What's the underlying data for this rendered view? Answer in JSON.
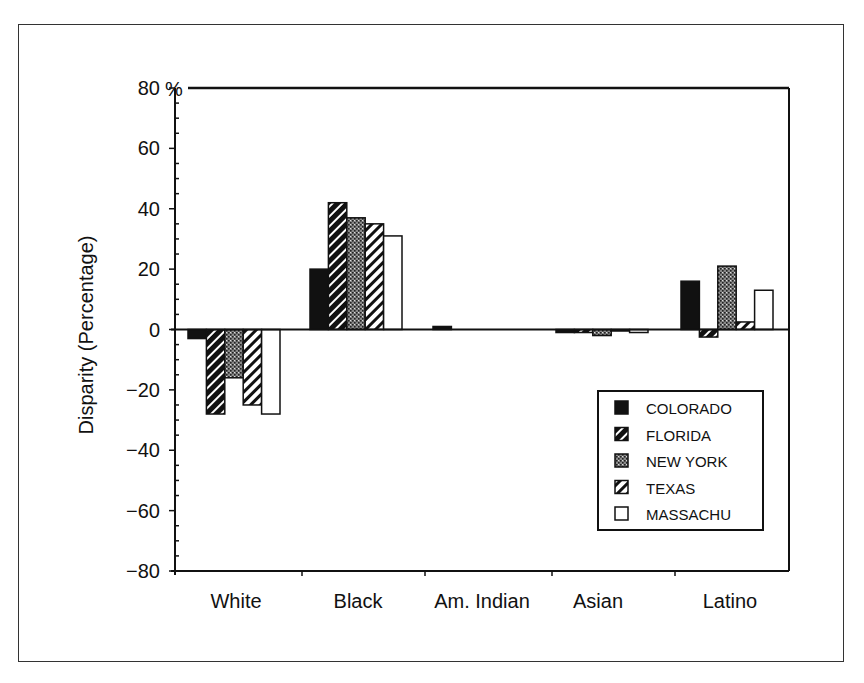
{
  "chart_data": {
    "type": "bar",
    "title": "",
    "xlabel": "",
    "ylabel": "Disparity (Percentage)",
    "y_unit_label": "%",
    "ylim": [
      -80,
      80
    ],
    "yticks": [
      80,
      60,
      40,
      20,
      0,
      -20,
      -40,
      -60,
      -80
    ],
    "ytick_labels": [
      "80",
      "60",
      "40",
      "20",
      "0",
      "−20",
      "−40",
      "−60",
      "−80"
    ],
    "grid": false,
    "legend_position": "lower right (inside)",
    "categories": [
      "White",
      "Black",
      "Am. Indian",
      "Asian",
      "Latino"
    ],
    "series": [
      {
        "name": "COLORADO",
        "pattern": "solid-black",
        "values": [
          -3,
          20,
          1,
          -1,
          16
        ]
      },
      {
        "name": "FLORIDA",
        "pattern": "dark-hatch",
        "values": [
          -28,
          42,
          0,
          -1,
          -2.5
        ]
      },
      {
        "name": "NEW YORK",
        "pattern": "stipple-gray",
        "values": [
          -16,
          37,
          0,
          -2,
          21
        ]
      },
      {
        "name": "TEXAS",
        "pattern": "light-hatch",
        "values": [
          -25,
          35,
          0,
          -0.5,
          2.5
        ]
      },
      {
        "name": "MASSACHU",
        "pattern": "white",
        "values": [
          -28,
          31,
          0,
          -1,
          13
        ]
      }
    ]
  }
}
